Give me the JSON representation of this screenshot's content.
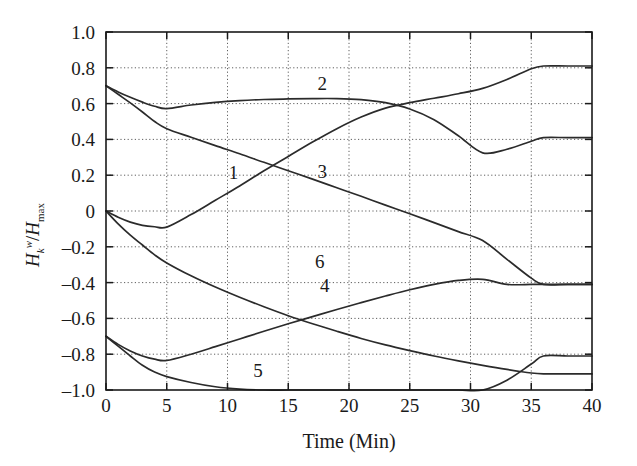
{
  "chart_data": {
    "type": "line",
    "title": "",
    "xlabel": "Time (Min)",
    "ylabel": "H_k^w / H_max",
    "ylabel_parts": {
      "base": "H",
      "sub": "k",
      "sup": "w",
      "denom_base": "H",
      "denom_sub": "max"
    },
    "xlim": [
      0,
      40
    ],
    "ylim": [
      -1.0,
      1.0
    ],
    "xticks": [
      0,
      5,
      10,
      15,
      20,
      25,
      30,
      35,
      40
    ],
    "xtick_labels": [
      "0",
      "5",
      "10",
      "15",
      "20",
      "25",
      "30",
      "35",
      "40"
    ],
    "yticks": [
      -1.0,
      -0.8,
      -0.6,
      -0.4,
      -0.2,
      0,
      0.2,
      0.4,
      0.6,
      0.8,
      1.0
    ],
    "ytick_labels": [
      "-1.0",
      "-0.8",
      "-0.6",
      "-0.4",
      "-0.2",
      "0",
      "0.2",
      "0.4",
      "0.6",
      "0.8",
      "1.0"
    ],
    "grid": true,
    "grid_style": "dotted",
    "legend_position": "inline-labels",
    "line_color": "#2b2b2b",
    "series": [
      {
        "name": "1",
        "label": "1",
        "label_x": 10.5,
        "label_y": 0.18,
        "x": [
          0,
          1,
          2,
          3,
          4,
          5,
          7,
          9,
          11,
          13,
          15,
          17,
          19,
          21,
          23,
          25,
          27,
          29,
          31,
          33,
          35,
          36,
          38,
          40
        ],
        "y": [
          0.0,
          -0.035,
          -0.062,
          -0.08,
          -0.088,
          -0.09,
          -0.02,
          0.06,
          0.14,
          0.225,
          0.305,
          0.385,
          0.46,
          0.525,
          0.575,
          0.605,
          0.63,
          0.655,
          0.685,
          0.735,
          0.795,
          0.81,
          0.81,
          0.81
        ]
      },
      {
        "name": "2",
        "label": "2",
        "label_x": 17.8,
        "label_y": 0.675,
        "x": [
          0,
          1,
          2,
          3,
          4,
          5,
          7,
          9,
          11,
          13,
          15,
          17,
          19,
          21,
          23,
          25,
          27,
          29,
          31,
          33,
          35,
          36,
          38,
          40
        ],
        "y": [
          0.7,
          0.665,
          0.635,
          0.608,
          0.585,
          0.572,
          0.592,
          0.607,
          0.617,
          0.623,
          0.626,
          0.628,
          0.628,
          0.622,
          0.605,
          0.57,
          0.51,
          0.42,
          0.325,
          0.345,
          0.39,
          0.41,
          0.41,
          0.41
        ]
      },
      {
        "name": "3",
        "label": "3",
        "label_x": 17.8,
        "label_y": 0.185,
        "x": [
          0,
          1,
          2,
          3,
          4,
          5,
          7,
          9,
          11,
          13,
          15,
          17,
          19,
          21,
          23,
          25,
          27,
          29,
          31,
          33,
          35,
          36,
          38,
          40
        ],
        "y": [
          0.7,
          0.652,
          0.604,
          0.553,
          0.5,
          0.46,
          0.412,
          0.365,
          0.32,
          0.272,
          0.225,
          0.178,
          0.13,
          0.082,
          0.033,
          -0.015,
          -0.065,
          -0.115,
          -0.165,
          -0.27,
          -0.375,
          -0.41,
          -0.41,
          -0.41
        ]
      },
      {
        "name": "4",
        "label": "4",
        "label_x": 18.0,
        "label_y": -0.455,
        "x": [
          0,
          1,
          2,
          3,
          4,
          5,
          7,
          9,
          11,
          13,
          15,
          17,
          19,
          21,
          23,
          25,
          27,
          29,
          31,
          33,
          35,
          36,
          38,
          40
        ],
        "y": [
          0.0,
          -0.072,
          -0.135,
          -0.19,
          -0.245,
          -0.29,
          -0.362,
          -0.425,
          -0.482,
          -0.535,
          -0.585,
          -0.63,
          -0.672,
          -0.712,
          -0.748,
          -0.78,
          -0.81,
          -0.837,
          -0.862,
          -0.885,
          -0.905,
          -0.91,
          -0.91,
          -0.91
        ]
      },
      {
        "name": "5",
        "label": "5",
        "label_x": 12.5,
        "label_y": -0.925,
        "x": [
          0,
          1,
          2,
          3,
          4,
          5,
          7,
          9,
          11,
          13,
          15,
          17,
          19,
          21,
          23,
          25,
          27,
          29,
          31,
          33,
          35,
          36,
          38,
          40
        ],
        "y": [
          -0.7,
          -0.755,
          -0.81,
          -0.862,
          -0.9,
          -0.925,
          -0.958,
          -0.982,
          -0.995,
          -1.0,
          -1.0,
          -1.0,
          -1.0,
          -1.0,
          -1.0,
          -1.0,
          -1.0,
          -1.0,
          -1.0,
          -0.945,
          -0.855,
          -0.81,
          -0.81,
          -0.81
        ]
      },
      {
        "name": "6",
        "label": "6",
        "label_x": 17.6,
        "label_y": -0.32,
        "x": [
          0,
          1,
          2,
          3,
          4,
          5,
          7,
          9,
          11,
          13,
          15,
          17,
          19,
          21,
          23,
          25,
          27,
          29,
          31,
          33,
          35,
          36,
          38,
          40
        ],
        "y": [
          -0.7,
          -0.745,
          -0.782,
          -0.81,
          -0.828,
          -0.835,
          -0.8,
          -0.758,
          -0.715,
          -0.672,
          -0.63,
          -0.59,
          -0.55,
          -0.512,
          -0.475,
          -0.44,
          -0.41,
          -0.388,
          -0.382,
          -0.41,
          -0.41,
          -0.41,
          -0.41,
          -0.41
        ]
      }
    ]
  }
}
